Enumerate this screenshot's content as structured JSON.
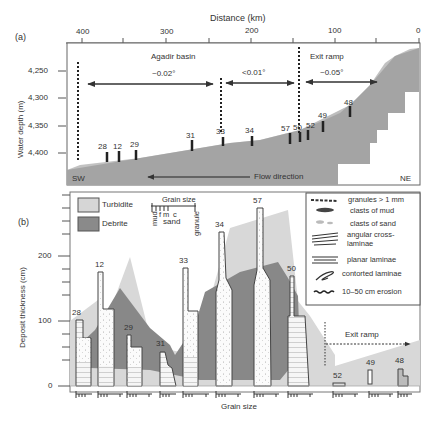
{
  "panel_a": {
    "label": "(a)",
    "x_axis_title": "Distance (km)",
    "x_ticks": [
      "400",
      "300",
      "200",
      "100",
      "0"
    ],
    "y_axis_title": "Water depth (m)",
    "y_ticks": [
      "4,250",
      "4,300",
      "4,350",
      "4,400"
    ],
    "regions": [
      {
        "name": "Agadir basin",
        "gradient": "~0.02°"
      },
      {
        "name": "",
        "gradient": "<0.01°"
      },
      {
        "name": "Exit ramp",
        "gradient": "~0.05°"
      }
    ],
    "cores": [
      "28",
      "12",
      "29",
      "31",
      "33",
      "34",
      "57",
      "50",
      "52",
      "49",
      "48"
    ],
    "sw_label": "SW",
    "ne_label": "NE",
    "flow_label": "Flow direction"
  },
  "panel_b": {
    "label": "(b)",
    "y_axis_title": "Deposit thickness (cm)",
    "y_ticks": [
      "0",
      "100",
      "200"
    ],
    "x_axis_title": "Grain size",
    "legend_fill": [
      {
        "name": "Turbidite",
        "color": "#d6d6d6"
      },
      {
        "name": "Debrite",
        "color": "#8a8a8a"
      }
    ],
    "grain_scale": {
      "title": "Grain size",
      "labels": [
        "mud",
        "f",
        "m",
        "c",
        "sand",
        "granule"
      ]
    },
    "legend_symbols": [
      {
        "icon": "granules-icon",
        "label": "granules > 1 mm"
      },
      {
        "icon": "mud-clast-icon",
        "label": "clasts of mud"
      },
      {
        "icon": "sand-clast-icon",
        "label": "clasts of sand"
      },
      {
        "icon": "cross-laminae-icon",
        "label": "angular cross-laminae"
      },
      {
        "icon": "planar-laminae-icon",
        "label": "planar laminae"
      },
      {
        "icon": "contorted-laminae-icon",
        "label": "contorted laminae"
      },
      {
        "icon": "erosion-icon",
        "label": "10–50 cm erosion"
      }
    ],
    "exit_ramp_label": "Exit ramp",
    "cores": [
      {
        "id": "28",
        "thickness_cm": 102
      },
      {
        "id": "12",
        "thickness_cm": 175
      },
      {
        "id": "29",
        "thickness_cm": 78
      },
      {
        "id": "31",
        "thickness_cm": 53
      },
      {
        "id": "33",
        "thickness_cm": 183
      },
      {
        "id": "34",
        "thickness_cm": 250
      },
      {
        "id": "57",
        "thickness_cm": 277
      },
      {
        "id": "50",
        "thickness_cm": 170
      },
      {
        "id": "52",
        "thickness_cm": 5
      },
      {
        "id": "49",
        "thickness_cm": 23
      },
      {
        "id": "48",
        "thickness_cm": 25
      }
    ]
  }
}
